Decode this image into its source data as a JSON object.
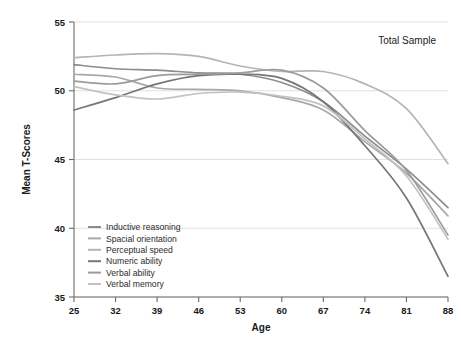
{
  "chart_data": {
    "type": "line",
    "title": "",
    "annotation": "Total Sample",
    "xlabel": "Age",
    "ylabel": "Mean T-Scores",
    "grid": true,
    "legend_position": "inside-bottom-left",
    "x": [
      25,
      32,
      39,
      46,
      53,
      60,
      67,
      74,
      81,
      88
    ],
    "xticklabels": [
      "25",
      "32",
      "39",
      "46",
      "53",
      "60",
      "67",
      "74",
      "81",
      "88"
    ],
    "yticklabels": [
      "35",
      "40",
      "45",
      "50",
      "55"
    ],
    "xlim": [
      25,
      88
    ],
    "ylim": [
      35,
      55
    ],
    "series": [
      {
        "name": "Inductive reasoning",
        "color": "#8c8c8c",
        "values": [
          51.9,
          51.6,
          51.5,
          51.3,
          51.2,
          50.6,
          49.2,
          46.7,
          44.3,
          41.5
        ]
      },
      {
        "name": "Spacial orientation",
        "color": "#a8a8a8",
        "values": [
          51.2,
          51.0,
          50.2,
          50.1,
          50.0,
          49.5,
          48.6,
          46.3,
          44.0,
          40.9
        ]
      },
      {
        "name": "Perceptual speed",
        "color": "#b5b5b5",
        "values": [
          52.4,
          52.6,
          52.7,
          52.5,
          51.8,
          51.4,
          51.4,
          50.5,
          48.7,
          44.7
        ]
      },
      {
        "name": "Numeric ability",
        "color": "#767676",
        "values": [
          48.6,
          49.5,
          50.5,
          51.1,
          51.2,
          50.9,
          49.2,
          46.0,
          42.2,
          36.5
        ]
      },
      {
        "name": "Verbal ability",
        "color": "#9b9b9b",
        "values": [
          50.7,
          50.5,
          51.1,
          51.2,
          51.3,
          51.5,
          50.2,
          47.1,
          44.2,
          39.5
        ]
      },
      {
        "name": "Verbal memory",
        "color": "#c2c2c2",
        "values": [
          50.3,
          49.7,
          49.4,
          49.8,
          49.9,
          49.6,
          48.9,
          46.5,
          43.8,
          39.2
        ]
      }
    ]
  }
}
